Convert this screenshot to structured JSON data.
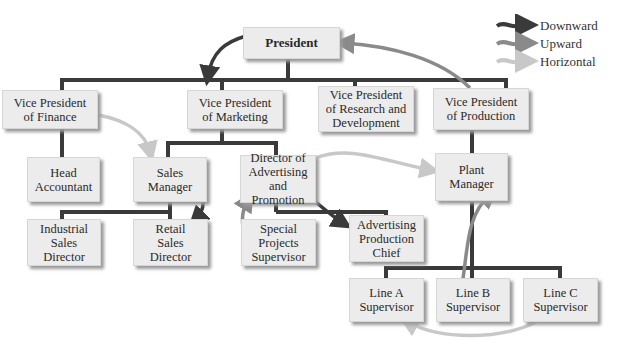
{
  "diagram": {
    "legend": [
      {
        "label": "Downward",
        "color": "#3a3a3a"
      },
      {
        "label": "Upward",
        "color": "#8a8a8a"
      },
      {
        "label": "Horizontal",
        "color": "#c8c8c8"
      }
    ],
    "nodes": {
      "president": "President",
      "vp_finance": "Vice President\nof Finance",
      "vp_marketing": "Vice President\nof Marketing",
      "vp_rd": "Vice President\nof Research and\nDevelopment",
      "vp_production": "Vice President\nof Production",
      "head_accountant": "Head\nAccountant",
      "sales_manager": "Sales\nManager",
      "director_advertising": "Director of\nAdvertising and\nPromotion",
      "plant_manager": "Plant\nManager",
      "industrial_sales_director": "Industrial\nSales\nDirector",
      "retail_sales_director": "Retail\nSales\nDirector",
      "special_projects_supervisor": "Special\nProjects\nSupervisor",
      "advertising_production_chief": "Advertising\nProduction\nChief",
      "line_a_supervisor": "Line A\nSupervisor",
      "line_b_supervisor": "Line B\nSupervisor",
      "line_c_supervisor": "Line C\nSupervisor"
    },
    "flows": [
      {
        "type": "Downward",
        "from": "President",
        "to": "Vice President of Marketing"
      },
      {
        "type": "Upward",
        "from": "Vice President of Production",
        "to": "President"
      },
      {
        "type": "Horizontal",
        "from": "Vice President of Finance",
        "to": "Sales Manager"
      },
      {
        "type": "Downward",
        "from": "Sales Manager",
        "to": "Retail Sales Director"
      },
      {
        "type": "Horizontal",
        "from": "Director of Advertising and Promotion",
        "to": "Plant Manager"
      },
      {
        "type": "Upward",
        "from": "Special Projects Supervisor",
        "to": "Director of Advertising and Promotion"
      },
      {
        "type": "Downward",
        "from": "Director of Advertising and Promotion",
        "to": "Advertising Production Chief"
      },
      {
        "type": "Upward",
        "from": "Line B Supervisor",
        "to": "Plant Manager"
      },
      {
        "type": "Horizontal",
        "from": "Line C Supervisor",
        "to": "Line A Supervisor"
      }
    ]
  }
}
